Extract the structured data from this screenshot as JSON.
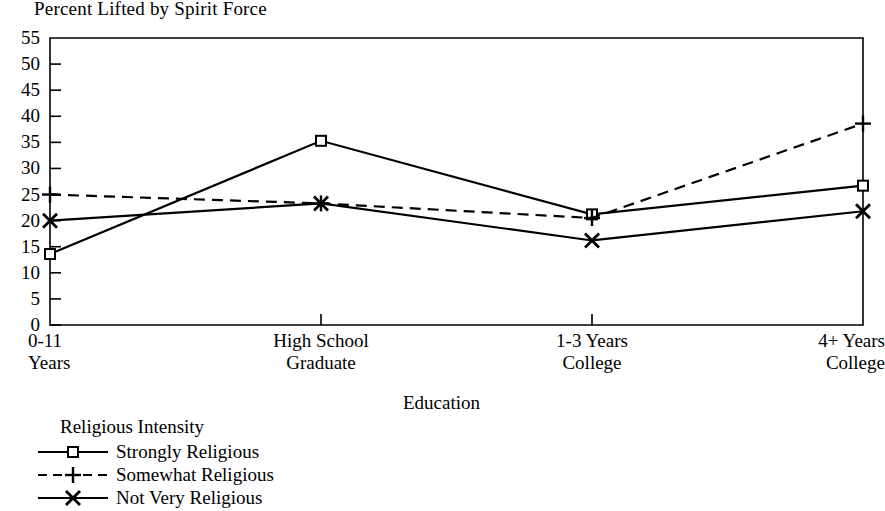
{
  "chart_data": {
    "type": "line",
    "title": "Percent Lifted by Spirit Force",
    "xlabel": "Education",
    "ylabel": "",
    "categories": [
      "0-11\nYears",
      "High School\nGraduate",
      "1-3 Years\nCollege",
      "4+ Years\nCollege"
    ],
    "category_lines": [
      [
        "0-11",
        "Years"
      ],
      [
        "High School",
        "Graduate"
      ],
      [
        "1-3 Years",
        "College"
      ],
      [
        "4+ Years",
        "College"
      ]
    ],
    "ylim": [
      0,
      55
    ],
    "ytick_values": [
      0,
      5,
      10,
      15,
      20,
      25,
      30,
      35,
      40,
      45,
      50,
      55
    ],
    "ytick_labels": [
      "0",
      "5",
      "10",
      "15",
      "20",
      "25",
      "30",
      "35",
      "40",
      "45",
      "50",
      "55"
    ],
    "grid": false,
    "legend_position": "below-left",
    "legend_title": "Religious Intensity",
    "series": [
      {
        "name": "Strongly Religious",
        "values": [
          13.6,
          35.3,
          21.2,
          26.7
        ],
        "line_style": "solid",
        "marker": "square",
        "color": "#000000"
      },
      {
        "name": "Somewhat Religious",
        "values": [
          25.0,
          23.3,
          20.5,
          38.6
        ],
        "line_style": "dashed",
        "marker": "plus",
        "color": "#000000"
      },
      {
        "name": "Not Very Religious",
        "values": [
          20.0,
          23.3,
          16.2,
          21.8
        ],
        "line_style": "solid",
        "marker": "x",
        "color": "#000000"
      }
    ]
  }
}
